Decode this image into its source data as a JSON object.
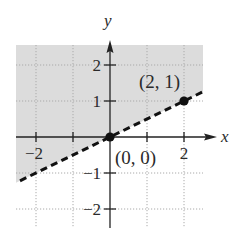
{
  "chart_data": {
    "type": "line",
    "title": "",
    "xlabel": "x",
    "ylabel": "y",
    "xlim": [
      -2.5,
      2.5
    ],
    "ylim": [
      -2.5,
      2.5
    ],
    "grid": true,
    "x_ticks": [
      -2,
      -1,
      0,
      1,
      2
    ],
    "y_ticks": [
      -2,
      -1,
      0,
      1,
      2
    ],
    "x_tick_labels": [
      {
        "value": -2,
        "label": "−2"
      },
      {
        "value": 2,
        "label": "2"
      }
    ],
    "y_tick_labels": [
      {
        "value": 2,
        "label": "2"
      },
      {
        "value": 1,
        "label": "1"
      },
      {
        "value": -1,
        "label": "−1"
      },
      {
        "value": -2,
        "label": "−2"
      }
    ],
    "series": [
      {
        "name": "boundary line y = x/2",
        "style": "dashed",
        "x": [
          -2.5,
          2.5
        ],
        "y": [
          -1.25,
          1.25
        ]
      }
    ],
    "shaded_region": {
      "description": "half-plane above the dashed line, y > x/2",
      "color": "#dcdcdc"
    },
    "points": [
      {
        "x": 0,
        "y": 0,
        "label": "(0, 0)"
      },
      {
        "x": 2,
        "y": 1,
        "label": "(2, 1)"
      }
    ],
    "annotations": [
      "(0, 0)",
      "(2, 1)"
    ]
  },
  "colors": {
    "shade": "#dcdcdc",
    "axis": "#222222",
    "grid": "#aaaaaa",
    "line": "#111111",
    "point": "#111111"
  }
}
